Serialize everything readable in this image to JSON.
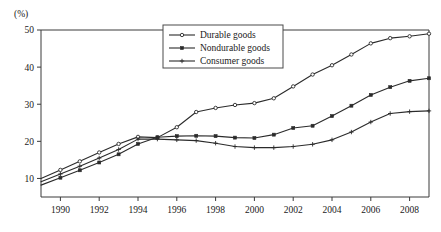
{
  "chart_data": {
    "type": "line",
    "title": "",
    "subtitle": "",
    "xlabel": "",
    "ylabel": "",
    "unit_label": "(%)",
    "xlim": [
      1989,
      2009
    ],
    "ylim": [
      5,
      50
    ],
    "grid": false,
    "legend_position": "top-center",
    "y_ticks": [
      10,
      20,
      30,
      40,
      50
    ],
    "y_tick_labels": [
      "10",
      "20",
      "30",
      "40",
      "50"
    ],
    "x_ticks": [
      1990,
      1992,
      1994,
      1996,
      1998,
      2000,
      2002,
      2004,
      2006,
      2008
    ],
    "x_tick_labels": [
      "1990",
      "1992",
      "1994",
      "1996",
      "1998",
      "2000",
      "2002",
      "2004",
      "2006",
      "2008"
    ],
    "x": [
      1989,
      1990,
      1991,
      1992,
      1993,
      1994,
      1995,
      1996,
      1997,
      1998,
      1999,
      2000,
      2001,
      2002,
      2003,
      2004,
      2005,
      2006,
      2007,
      2008,
      2009
    ],
    "series": [
      {
        "name": "Durable goods",
        "marker": "open-circle",
        "values": [
          10.0,
          12.3,
          14.6,
          17.0,
          19.3,
          21.2,
          21.0,
          23.8,
          27.9,
          29.0,
          29.8,
          30.3,
          31.6,
          34.8,
          38.0,
          40.5,
          43.4,
          46.4,
          47.8,
          48.3,
          49.0
        ]
      },
      {
        "name": "Nondurable goods",
        "marker": "solid-square",
        "values": [
          8.2,
          10.2,
          12.2,
          14.3,
          16.5,
          19.3,
          21.1,
          21.4,
          21.5,
          21.4,
          21.0,
          20.9,
          21.8,
          23.6,
          24.2,
          26.8,
          29.6,
          32.5,
          34.6,
          36.3,
          37.0
        ]
      },
      {
        "name": "Consumer goods",
        "marker": "plus",
        "values": [
          9.1,
          11.2,
          13.3,
          15.5,
          17.8,
          20.6,
          20.6,
          20.4,
          20.2,
          19.5,
          18.6,
          18.3,
          18.3,
          18.6,
          19.2,
          20.4,
          22.5,
          25.2,
          27.5,
          28.0,
          28.2
        ]
      }
    ]
  },
  "legend": {
    "entries": [
      {
        "label": "Durable goods"
      },
      {
        "label": "Nondurable goods"
      },
      {
        "label": "Consumer goods"
      }
    ]
  },
  "colors": {
    "background": "#ffffff",
    "line": "#2b2b2b",
    "axis": "#3a3a3a",
    "text": "#1a1a1a"
  }
}
